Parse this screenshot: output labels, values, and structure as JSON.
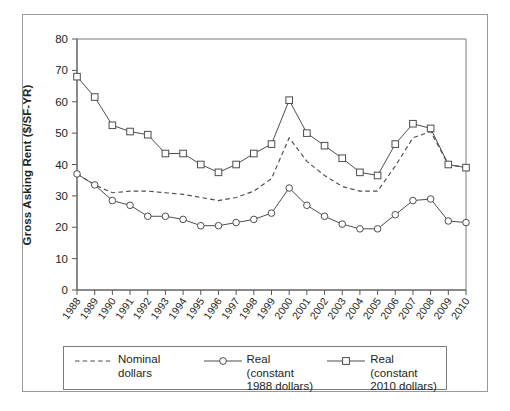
{
  "chart_data": {
    "type": "line",
    "title": "",
    "xlabel": "",
    "ylabel": "Gross Asking Rent ($/SF-YR)",
    "ylim": [
      0,
      80
    ],
    "yticks": [
      0,
      10,
      20,
      30,
      40,
      50,
      60,
      70,
      80
    ],
    "grid": false,
    "legend_position": "bottom",
    "categories": [
      "1988",
      "1989",
      "1990",
      "1991",
      "1992",
      "1993",
      "1994",
      "1995",
      "1996",
      "1997",
      "1998",
      "1999",
      "2000",
      "2001",
      "2002",
      "2003",
      "2004",
      "2005",
      "2006",
      "2007",
      "2008",
      "2009",
      "2010"
    ],
    "series": [
      {
        "name": "Nominal dollars",
        "style": "dashed",
        "marker": "none",
        "values": [
          37.0,
          33.5,
          31.0,
          31.5,
          31.5,
          31.0,
          30.5,
          29.5,
          28.5,
          29.5,
          31.5,
          35.5,
          48.5,
          41.0,
          36.5,
          33.0,
          31.5,
          31.5,
          39.5,
          48.5,
          50.5,
          40.0,
          39.0
        ]
      },
      {
        "name": "Real (constant\n1988 dollars)",
        "style": "solid",
        "marker": "circle",
        "values": [
          37.0,
          33.5,
          28.5,
          27.0,
          23.5,
          23.5,
          22.5,
          20.5,
          20.5,
          21.5,
          22.5,
          24.5,
          32.5,
          27.0,
          23.5,
          21.0,
          19.5,
          19.5,
          24.0,
          28.5,
          29.0,
          22.0,
          21.5
        ]
      },
      {
        "name": "Real (constant\n2010 dollars)",
        "style": "solid",
        "marker": "square",
        "values": [
          68.0,
          61.5,
          52.5,
          50.5,
          49.5,
          43.5,
          43.5,
          40.0,
          37.5,
          40.0,
          43.5,
          46.5,
          60.5,
          50.0,
          46.0,
          42.0,
          37.5,
          36.5,
          46.5,
          53.0,
          51.5,
          40.0,
          39.0
        ]
      }
    ]
  },
  "legend": {
    "entries": [
      {
        "label": "Nominal dollars",
        "style": "dashed",
        "marker": "none"
      },
      {
        "label": "Real (constant\n1988 dollars)",
        "style": "solid",
        "marker": "circle"
      },
      {
        "label": "Real (constant\n2010 dollars)",
        "style": "solid",
        "marker": "square"
      }
    ]
  },
  "colors": {
    "line": "#4d4d4f",
    "axis": "#58595b",
    "frame": "#9a9a9a",
    "plot_box": "#7d7d7d",
    "marker_fill": "#ffffff",
    "background": "#ffffff"
  }
}
